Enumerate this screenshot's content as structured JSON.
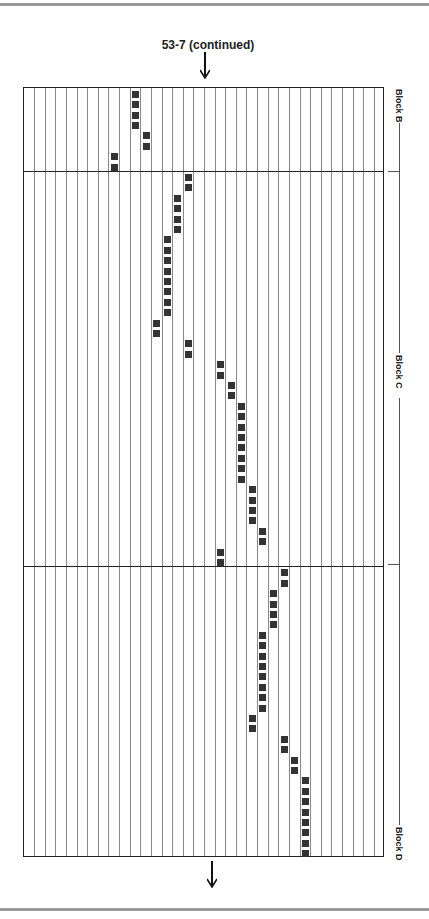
{
  "header": {
    "title": "53-7 (continued)"
  },
  "grid": {
    "columns": 34,
    "rows": 74,
    "square_color": "#333333",
    "blocks": [
      {
        "label": "Block B",
        "start_row": 0,
        "end_row": 7
      },
      {
        "label": "Block C",
        "start_row": 8,
        "end_row": 45
      },
      {
        "label": "Block D",
        "start_row": 46,
        "end_row": 73
      }
    ],
    "filled_cells": [
      [
        0,
        10
      ],
      [
        1,
        10
      ],
      [
        2,
        10
      ],
      [
        3,
        10
      ],
      [
        4,
        11
      ],
      [
        5,
        11
      ],
      [
        6,
        8
      ],
      [
        7,
        8
      ],
      [
        8,
        15
      ],
      [
        9,
        15
      ],
      [
        10,
        14
      ],
      [
        11,
        14
      ],
      [
        12,
        14
      ],
      [
        13,
        14
      ],
      [
        14,
        13
      ],
      [
        15,
        13
      ],
      [
        16,
        13
      ],
      [
        17,
        13
      ],
      [
        18,
        13
      ],
      [
        19,
        13
      ],
      [
        20,
        13
      ],
      [
        21,
        13
      ],
      [
        22,
        12
      ],
      [
        23,
        12
      ],
      [
        24,
        15
      ],
      [
        25,
        15
      ],
      [
        26,
        18
      ],
      [
        27,
        18
      ],
      [
        28,
        19
      ],
      [
        29,
        19
      ],
      [
        30,
        20
      ],
      [
        31,
        20
      ],
      [
        32,
        20
      ],
      [
        33,
        20
      ],
      [
        34,
        20
      ],
      [
        35,
        20
      ],
      [
        36,
        20
      ],
      [
        37,
        20
      ],
      [
        38,
        21
      ],
      [
        39,
        21
      ],
      [
        40,
        21
      ],
      [
        41,
        21
      ],
      [
        42,
        22
      ],
      [
        43,
        22
      ],
      [
        44,
        18
      ],
      [
        45,
        18
      ],
      [
        46,
        24
      ],
      [
        47,
        24
      ],
      [
        48,
        23
      ],
      [
        49,
        23
      ],
      [
        50,
        23
      ],
      [
        51,
        23
      ],
      [
        52,
        22
      ],
      [
        53,
        22
      ],
      [
        54,
        22
      ],
      [
        55,
        22
      ],
      [
        56,
        22
      ],
      [
        57,
        22
      ],
      [
        58,
        22
      ],
      [
        59,
        22
      ],
      [
        60,
        21
      ],
      [
        61,
        21
      ],
      [
        62,
        24
      ],
      [
        63,
        24
      ],
      [
        64,
        25
      ],
      [
        65,
        25
      ],
      [
        66,
        26
      ],
      [
        67,
        26
      ],
      [
        68,
        26
      ],
      [
        69,
        26
      ],
      [
        70,
        26
      ],
      [
        71,
        26
      ],
      [
        72,
        26
      ],
      [
        73,
        26
      ]
    ]
  },
  "labels": {
    "block_b": "Block B",
    "block_c": "Block C",
    "block_d": "Block D"
  },
  "icons": {
    "top_arrow": "arrow-down-icon",
    "bottom_arrow": "arrow-down-icon"
  }
}
